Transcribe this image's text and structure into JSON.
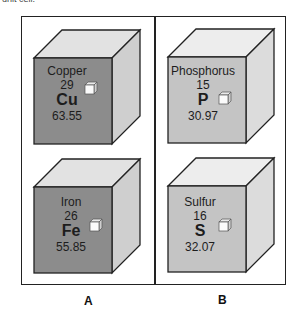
{
  "header_fragment": "unit cell.",
  "columns": [
    {
      "label": "A",
      "face_color": "#8c8c8c",
      "cubes": [
        {
          "name": "Copper",
          "atomic_number": "29",
          "symbol": "Cu",
          "atomic_mass": "63.55"
        },
        {
          "name": "Iron",
          "atomic_number": "26",
          "symbol": "Fe",
          "atomic_mass": "55.85"
        }
      ]
    },
    {
      "label": "B",
      "face_color": "#c4c4c4",
      "cubes": [
        {
          "name": "Phosphorus",
          "atomic_number": "15",
          "symbol": "P",
          "atomic_mass": "30.97"
        },
        {
          "name": "Sulfur",
          "atomic_number": "16",
          "symbol": "S",
          "atomic_mass": "32.07"
        }
      ]
    }
  ]
}
